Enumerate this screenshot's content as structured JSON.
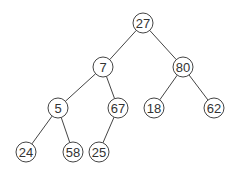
{
  "diagram": {
    "type": "binary-tree",
    "node_radius": 10,
    "colors": {
      "stroke": "#444444",
      "text": "#333333",
      "fill": "#ffffff"
    },
    "nodes": [
      {
        "id": "n27",
        "label": "27",
        "x": 143,
        "y": 23
      },
      {
        "id": "n7",
        "label": "7",
        "x": 103,
        "y": 67
      },
      {
        "id": "n80",
        "label": "80",
        "x": 183,
        "y": 67
      },
      {
        "id": "n5",
        "label": "5",
        "x": 58,
        "y": 108
      },
      {
        "id": "n67",
        "label": "67",
        "x": 118,
        "y": 108
      },
      {
        "id": "n18",
        "label": "18",
        "x": 154,
        "y": 108
      },
      {
        "id": "n62",
        "label": "62",
        "x": 214,
        "y": 108
      },
      {
        "id": "n24",
        "label": "24",
        "x": 26,
        "y": 152
      },
      {
        "id": "n58",
        "label": "58",
        "x": 73,
        "y": 152
      },
      {
        "id": "n25",
        "label": "25",
        "x": 99,
        "y": 152
      }
    ],
    "edges": [
      {
        "from": "n27",
        "to": "n7"
      },
      {
        "from": "n27",
        "to": "n80"
      },
      {
        "from": "n7",
        "to": "n5"
      },
      {
        "from": "n7",
        "to": "n67"
      },
      {
        "from": "n80",
        "to": "n18"
      },
      {
        "from": "n80",
        "to": "n62"
      },
      {
        "from": "n5",
        "to": "n24"
      },
      {
        "from": "n5",
        "to": "n58"
      },
      {
        "from": "n67",
        "to": "n25"
      }
    ]
  }
}
